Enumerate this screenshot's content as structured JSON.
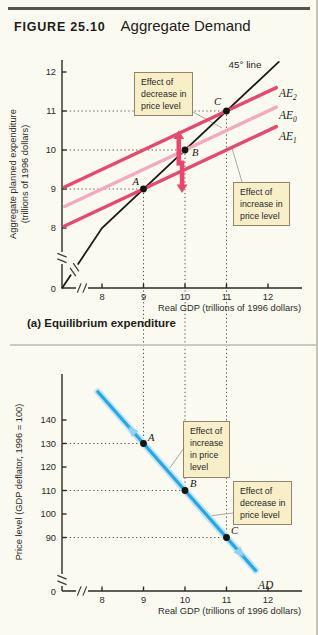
{
  "figure": {
    "label": "FIGURE 25.10",
    "title": "Aggregate Demand"
  },
  "panel_a_caption": "(a) Equilibrium expenditure",
  "colors": {
    "background": "#fbfaf0",
    "accent_pink": "#e8476e",
    "accent_pink_light": "#f4a9bd",
    "accent_blue": "#2aa7de",
    "accent_blue_light": "#bce4f7",
    "movement_arrow": "#8fd2f1",
    "callout_bg": "#f8efc9",
    "callout_border": "#8f866a",
    "axis": "#2b2a26",
    "dotted": "#45443f",
    "leader": "#a09e94",
    "header_rule": "#56534b",
    "divider": "#ccc9c0"
  },
  "chart_data": [
    {
      "type": "line",
      "panel": "a",
      "title": "(a) Equilibrium expenditure",
      "xlabel": "Real GDP (trillions of 1996 dollars)",
      "ylabel": "Aggregate planned expenditure",
      "ylabel2": "(trillions of 1996 dollars)",
      "xticks": [
        8,
        9,
        10,
        11,
        12
      ],
      "yticks": [
        8,
        9,
        10,
        11,
        12
      ],
      "origin_label": "0",
      "xlim": [
        0,
        12.6
      ],
      "ylim": [
        0,
        12.6
      ],
      "axis_break": true,
      "grid": false,
      "series": [
        {
          "name": "45-degree-line",
          "label": "45° line",
          "color": "#1b1b18",
          "width": 1.8,
          "points": [
            [
              7.04,
              6.46
            ],
            [
              8,
              8
            ],
            [
              12.26,
              12.26
            ]
          ]
        },
        {
          "name": "AE2",
          "label": "AE",
          "subscript": "2",
          "color": "#e8476e",
          "width": 3.4,
          "points": [
            [
              7.1,
              9.05
            ],
            [
              12.2,
              11.6
            ]
          ]
        },
        {
          "name": "AE0",
          "label": "AE",
          "subscript": "0",
          "color": "#f4a9bd",
          "width": 3.4,
          "points": [
            [
              7.1,
              8.55
            ],
            [
              12.2,
              11.1
            ]
          ]
        },
        {
          "name": "AE1",
          "label": "AE",
          "subscript": "1",
          "color": "#e8476e",
          "width": 3.4,
          "points": [
            [
              7.1,
              8.05
            ],
            [
              12.2,
              10.6
            ]
          ]
        }
      ],
      "points": [
        {
          "label": "A",
          "x": 9,
          "y": 9
        },
        {
          "label": "B",
          "x": 10,
          "y": 10
        },
        {
          "label": "C",
          "x": 11,
          "y": 11
        }
      ],
      "shift_arrows": [
        {
          "x": 9.85,
          "from": 9.6,
          "to": 10.5
        },
        {
          "x": 9.93,
          "from": 9.73,
          "to": 8.9
        }
      ],
      "callouts": [
        {
          "text": "Effect of\ndecrease in\nprice level"
        },
        {
          "text": "Effect of\nincrease in\nprice level"
        }
      ]
    },
    {
      "type": "line",
      "panel": "b",
      "xlabel": "Real GDP (trillions of 1996 dollars)",
      "ylabel": "Price level (GDP deflator, 1996 = 100)",
      "xticks": [
        8,
        9,
        10,
        11,
        12
      ],
      "yticks": [
        90,
        100,
        110,
        120,
        130,
        140
      ],
      "origin_label": "0",
      "xlim": [
        0,
        12.6
      ],
      "ylim": [
        0,
        155
      ],
      "axis_break": true,
      "grid": false,
      "series": [
        {
          "name": "AD",
          "label": "AD",
          "color": "#2aa7de",
          "width": 3.2,
          "glow": "#bce4f7",
          "points": [
            [
              7.9,
              152
            ],
            [
              11.7,
              76
            ]
          ]
        }
      ],
      "points": [
        {
          "label": "A",
          "x": 9,
          "y": 130
        },
        {
          "label": "B",
          "x": 10,
          "y": 110
        },
        {
          "label": "C",
          "x": 11,
          "y": 90
        }
      ],
      "movement_arrows": [
        {
          "x": 8.75,
          "direction": "up"
        },
        {
          "x": 11.3,
          "direction": "down"
        }
      ],
      "callouts": [
        {
          "text": "Effect of\nincrease\nin price\nlevel"
        },
        {
          "text": "Effect of\ndecrease in\nprice level"
        }
      ]
    }
  ]
}
